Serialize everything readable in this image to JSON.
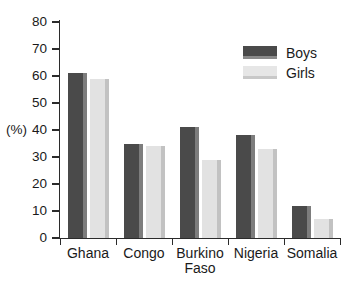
{
  "chart_data": {
    "type": "bar",
    "title": "",
    "xlabel": "",
    "ylabel": "(%)",
    "ylim": [
      0,
      80
    ],
    "ytick_values": [
      80,
      70,
      60,
      50,
      40,
      30,
      20,
      10,
      0
    ],
    "ytick_labels": [
      "80",
      "70",
      "60",
      "50",
      "40",
      "30",
      "20",
      "10",
      "0"
    ],
    "grid": false,
    "legend_position": "top-right",
    "categories": [
      "Ghana",
      "Congo",
      "Burkino\nFaso",
      "Nigeria",
      "Somalia"
    ],
    "series": [
      {
        "name": "Boys",
        "color": "#4a4a4a",
        "values": [
          61,
          35,
          41,
          38,
          12
        ]
      },
      {
        "name": "Girls",
        "color": "#e2e2e2",
        "values": [
          59,
          34,
          29,
          33,
          7
        ]
      }
    ]
  }
}
